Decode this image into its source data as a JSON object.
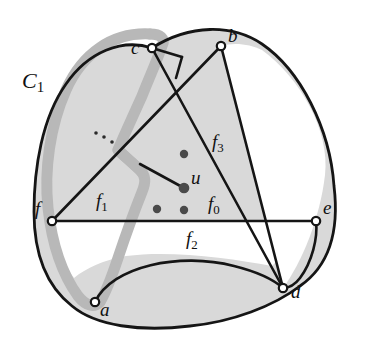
{
  "figure": {
    "type": "planar-graph-diagram",
    "width": 365,
    "height": 347
  },
  "colors": {
    "background": "#ffffff",
    "region_fill": "#d9d9d9",
    "stroke": "#151515",
    "highlight": "#b8b8b8",
    "node_fill": "#ffffff",
    "dot_fill": "#4a4a4a",
    "text": "#101010"
  },
  "nodes": [
    {
      "id": "a",
      "label": "a",
      "x": 95,
      "y": 302,
      "label_x": 100,
      "label_y": 306
    },
    {
      "id": "b",
      "label": "b",
      "x": 221,
      "y": 46,
      "label_x": 228,
      "label_y": 32
    },
    {
      "id": "c",
      "label": "c",
      "x": 152,
      "y": 48,
      "label_x": 131,
      "label_y": 44
    },
    {
      "id": "d",
      "label": "d",
      "x": 283,
      "y": 288,
      "label_x": 291,
      "label_y": 288
    },
    {
      "id": "e",
      "label": "e",
      "x": 316,
      "y": 221,
      "label_x": 323,
      "label_y": 204
    },
    {
      "id": "f",
      "label": "f",
      "x": 52,
      "y": 221,
      "label_x": 35,
      "label_y": 205
    },
    {
      "id": "u",
      "label": "u",
      "x": 184,
      "y": 188,
      "label_x": 191,
      "label_y": 174
    }
  ],
  "inner_dots": [
    {
      "id": "dot-1",
      "x": 184,
      "y": 154
    },
    {
      "id": "dot-2",
      "x": 157,
      "y": 209
    },
    {
      "id": "dot-3",
      "x": 184,
      "y": 210
    }
  ],
  "ellipsis_dots": [
    {
      "id": "ell-1",
      "x": 96,
      "y": 133
    },
    {
      "id": "ell-2",
      "x": 104,
      "y": 137
    },
    {
      "id": "ell-3",
      "x": 112,
      "y": 142
    }
  ],
  "face_labels": [
    {
      "id": "f0",
      "base": "f",
      "sub": "0",
      "x": 208,
      "y": 202
    },
    {
      "id": "f1",
      "base": "f",
      "sub": "1",
      "x": 96,
      "y": 199
    },
    {
      "id": "f2",
      "base": "f",
      "sub": "2",
      "x": 186,
      "y": 237
    },
    {
      "id": "f3",
      "base": "f",
      "sub": "3",
      "x": 212,
      "y": 140
    }
  ],
  "cycle_label": {
    "id": "C1",
    "base": "C",
    "sub": "1",
    "x": 22,
    "y": 80
  },
  "legend": {
    "cycle_name": "C1",
    "vertex_of_interest": "u"
  }
}
